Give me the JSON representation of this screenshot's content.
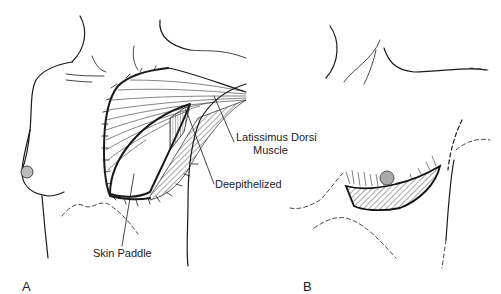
{
  "figure": {
    "panels": [
      {
        "id": "A",
        "letter": "A"
      },
      {
        "id": "B",
        "letter": "B"
      }
    ],
    "labels": {
      "latissimus_line1": "Latissimus Dorsi",
      "latissimus_line2": "Muscle",
      "deepithelized": "Deepithelized",
      "skin_paddle": "Skin Paddle"
    },
    "colors": {
      "line": "#1a1a1a",
      "background": "#ffffff"
    }
  }
}
